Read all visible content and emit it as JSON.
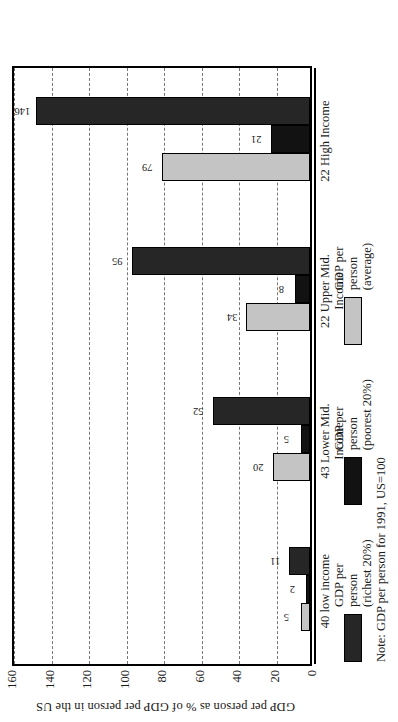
{
  "chart_data": {
    "type": "bar",
    "orientation": "vertical-grouped",
    "title": "",
    "ylabel": "GDP per person as % of GDP per person in the US",
    "xlabel": "",
    "ylim": [
      0,
      160
    ],
    "yticks": [
      160,
      140,
      120,
      100,
      80,
      60,
      40,
      20,
      0
    ],
    "ytick_labels": [
      "160",
      "140",
      "120",
      "100",
      "80",
      "60",
      "40",
      "20",
      "0"
    ],
    "grid": true,
    "grid_style": "dashed",
    "legend_position": "bottom",
    "categories": [
      "40 low income",
      "43 Lower Mid.\nIncome",
      "22 Upper Mid.\nIncome",
      "22 High Income"
    ],
    "series": [
      {
        "name": "GDP per\nperson\n(average)",
        "color": "#c4c4c4",
        "values": [
          5,
          20,
          34,
          79
        ]
      },
      {
        "name": "GDP per\nperson\n(poorest 20%)",
        "color": "#121212",
        "values": [
          2,
          5,
          8,
          21
        ]
      },
      {
        "name": "GDP per\nperson\n(richest 20%)",
        "color": "#262626",
        "values": [
          11,
          52,
          95,
          146
        ]
      }
    ],
    "note": "Note: GDP per person for 1991, US=100"
  },
  "legend": {
    "items": [
      {
        "label": "GDP per\nperson\n(richest 20%)",
        "color": "#262626"
      },
      {
        "label": "GDP per\nperson\n(poorest 20%)",
        "color": "#121212"
      },
      {
        "label": "GDP per\nperson\n(average)",
        "color": "#c4c4c4"
      }
    ]
  },
  "axis": {
    "ylabel": "GDP per person as % of GDP per person in the US",
    "ticks": [
      "160",
      "140",
      "120",
      "100",
      "80",
      "60",
      "40",
      "20",
      "0"
    ]
  },
  "note": {
    "text": "Note: GDP per person for 1991, US=100"
  }
}
